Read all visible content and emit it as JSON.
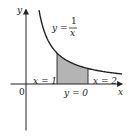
{
  "chart_data": {
    "type": "area",
    "title": "",
    "function": "y = 1/x",
    "curve_label": {
      "lhs": "y =",
      "numerator": "1",
      "denominator": "x"
    },
    "x_range_curve": [
      0.42,
      3.1
    ],
    "shaded_interval": [
      1,
      2
    ],
    "boundary_labels": {
      "left": "x = 1",
      "right": "x = 2",
      "bottom": "y = 0"
    },
    "xlabel": "x",
    "ylabel": "y",
    "origin_label": "0",
    "xlim": [
      -0.5,
      3.1
    ],
    "ylim": [
      -1.5,
      2.4
    ],
    "grid": false,
    "colors": {
      "curve": "#222222",
      "axes": "#222222",
      "shade": "#b4b4b4"
    }
  }
}
